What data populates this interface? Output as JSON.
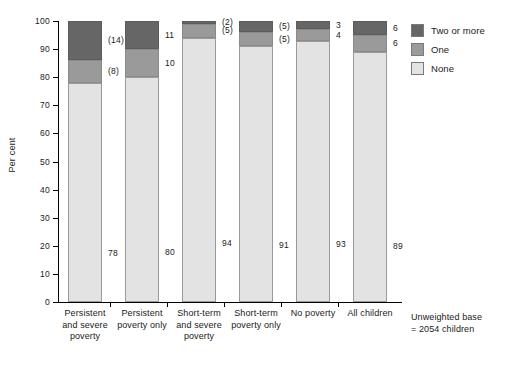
{
  "chart_data": {
    "type": "bar",
    "subtype": "stacked-column-100",
    "title": "",
    "xlabel": "",
    "ylabel": "Per cent",
    "ylim": [
      0,
      100
    ],
    "yticks": [
      0,
      10,
      20,
      30,
      40,
      50,
      60,
      70,
      80,
      90,
      100
    ],
    "grid": false,
    "legend_position": "top-right",
    "categories": [
      "Persistent and severe poverty",
      "Persistent poverty only",
      "Short-term and severe poverty",
      "Short-term poverty only",
      "No poverty",
      "All children"
    ],
    "category_lines": [
      [
        "Persistent",
        "and severe",
        "poverty"
      ],
      [
        "Persistent",
        "poverty only"
      ],
      [
        "Short-term",
        "and severe",
        "poverty"
      ],
      [
        "Short-term",
        "poverty only"
      ],
      [
        "No poverty"
      ],
      [
        "All children"
      ]
    ],
    "series": [
      {
        "name": "None",
        "color": "#e3e3e3",
        "values": [
          78,
          80,
          94,
          91,
          93,
          89
        ],
        "labels": [
          "78",
          "80",
          "94",
          "91",
          "93",
          "89"
        ]
      },
      {
        "name": "One",
        "color": "#9a9a9a",
        "values": [
          8,
          10,
          5,
          5,
          4,
          6
        ],
        "labels": [
          "(8)",
          "10",
          "(5)",
          "(5)",
          "4",
          "6"
        ]
      },
      {
        "name": "Two or more",
        "color": "#666666",
        "values": [
          14,
          11,
          2,
          5,
          3,
          6
        ],
        "labels": [
          "(14)",
          "11",
          "(2)",
          "(5)",
          "3",
          "6"
        ]
      }
    ],
    "legend": [
      {
        "label": "Two or more",
        "color": "#666666"
      },
      {
        "label": "One",
        "color": "#9a9a9a"
      },
      {
        "label": "None",
        "color": "#e3e3e3"
      }
    ],
    "notes": {
      "base": "Unweighted base\n= 2054 children"
    },
    "label_note": "Values shown in parentheses are based on small cell sizes"
  }
}
